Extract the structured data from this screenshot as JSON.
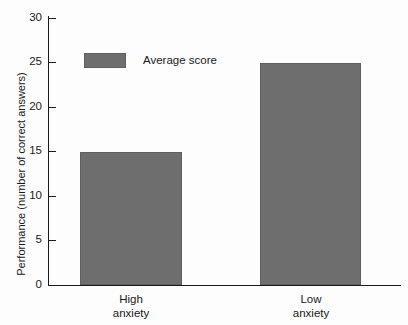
{
  "chart_data": {
    "type": "bar",
    "title": "",
    "xlabel": "",
    "ylabel": "Performance (number of correct answers)",
    "categories": [
      "High\nanxiety",
      "Low\nanxiety"
    ],
    "values": [
      15,
      25
    ],
    "series": [
      {
        "name": "Average score",
        "values": [
          15,
          25
        ],
        "color": "#6e6e6e"
      }
    ],
    "ylim": [
      0,
      30
    ],
    "yticks": [
      0,
      5,
      10,
      15,
      20,
      25,
      30
    ],
    "ytick_labels": [
      "0",
      "5",
      "10",
      "15",
      "20",
      "25",
      "30"
    ],
    "grid": false,
    "legend": {
      "position": "inside-upper-left",
      "entries": [
        {
          "label": "Average score",
          "color": "#6e6e6e"
        }
      ]
    }
  }
}
